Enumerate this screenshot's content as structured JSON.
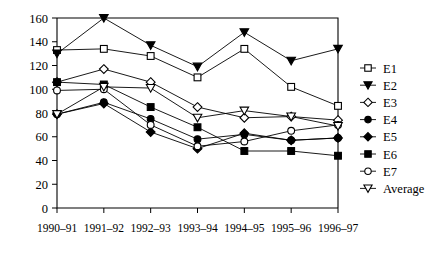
{
  "chart_data": {
    "type": "line",
    "title": "",
    "xlabel": "",
    "ylabel": "",
    "ylim": [
      0,
      160
    ],
    "ytick_step": 20,
    "yticks": [
      0,
      20,
      40,
      60,
      80,
      100,
      120,
      140,
      160
    ],
    "grid": false,
    "legend_position": "right",
    "categories": [
      "1990–91",
      "1991–92",
      "1992–93",
      "1993–94",
      "1994–95",
      "1995–96",
      "1996–97"
    ],
    "series": [
      {
        "name": "E1",
        "marker": "open-square",
        "values": [
          133,
          134,
          128,
          110,
          134,
          102,
          86
        ]
      },
      {
        "name": "E2",
        "marker": "filled-triangle-down",
        "values": [
          130,
          160,
          137,
          119,
          148,
          124,
          134
        ]
      },
      {
        "name": "E3",
        "marker": "open-diamond",
        "values": [
          106,
          117,
          106,
          85,
          76,
          77,
          74
        ]
      },
      {
        "name": "E4",
        "marker": "filled-circle",
        "values": [
          79,
          89,
          75,
          58,
          62,
          57,
          59
        ]
      },
      {
        "name": "E5",
        "marker": "filled-diamond",
        "values": [
          79,
          88,
          64,
          50,
          63,
          57,
          59
        ]
      },
      {
        "name": "E6",
        "marker": "filled-square",
        "values": [
          106,
          104,
          85,
          68,
          48,
          48,
          44
        ]
      },
      {
        "name": "E7",
        "marker": "open-circle",
        "values": [
          99,
          100,
          70,
          52,
          56,
          65,
          70
        ]
      },
      {
        "name": "Average",
        "marker": "open-triangle-down",
        "values": [
          79,
          102,
          101,
          76,
          82,
          77,
          69
        ]
      }
    ]
  },
  "legend": {
    "items": [
      {
        "label": "E1"
      },
      {
        "label": "E2"
      },
      {
        "label": "E3"
      },
      {
        "label": "E4"
      },
      {
        "label": "E5"
      },
      {
        "label": "E6"
      },
      {
        "label": "E7"
      },
      {
        "label": "Average"
      }
    ]
  },
  "colors": {
    "ink": "#000000",
    "background": "#ffffff",
    "marker_fill_open": "#ffffff"
  }
}
